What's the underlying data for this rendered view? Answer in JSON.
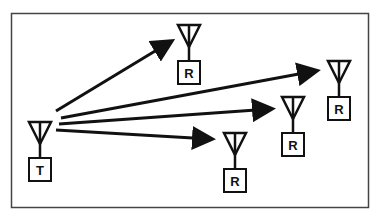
{
  "diagram": {
    "colors": {
      "stroke": "#111111",
      "frame": "#444444",
      "background": "#ffffff"
    },
    "transmitter": {
      "label": "T",
      "x": 40,
      "y": 121
    },
    "receivers": [
      {
        "label": "R",
        "x": 189,
        "y": 24
      },
      {
        "label": "R",
        "x": 339,
        "y": 60
      },
      {
        "label": "R",
        "x": 293,
        "y": 96
      },
      {
        "label": "R",
        "x": 235,
        "y": 132
      }
    ],
    "links": [
      {
        "from": "T",
        "to": 0
      },
      {
        "from": "T",
        "to": 1
      },
      {
        "from": "T",
        "to": 2
      },
      {
        "from": "T",
        "to": 3
      }
    ]
  }
}
